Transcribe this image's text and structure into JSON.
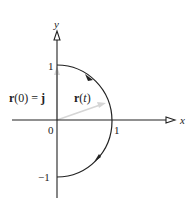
{
  "diagram": {
    "axes": {
      "x_label": "x",
      "y_label": "y",
      "origin_label": "0",
      "x_tick_label": "1",
      "y_tick_pos_label": "1",
      "y_tick_neg_label": "−1"
    },
    "curve": {
      "description": "right semicircle of unit circle traversed clockwise from (0,1) to (0,-1)",
      "start": [
        0,
        1
      ],
      "end": [
        0,
        -1
      ],
      "direction": "clockwise"
    },
    "vectors": {
      "r0": {
        "label_vec": "r",
        "label_arg": "(0) = ",
        "label_rhs": "j",
        "to": [
          0,
          1
        ]
      },
      "rt": {
        "label_vec": "r",
        "label_arg_open": "(",
        "label_t": "t",
        "label_arg_close": ")",
        "to": [
          0.87,
          0.3
        ]
      }
    },
    "colors": {
      "axis": "#222222",
      "curve": "#222222",
      "vector": "#d8d8d8"
    }
  }
}
